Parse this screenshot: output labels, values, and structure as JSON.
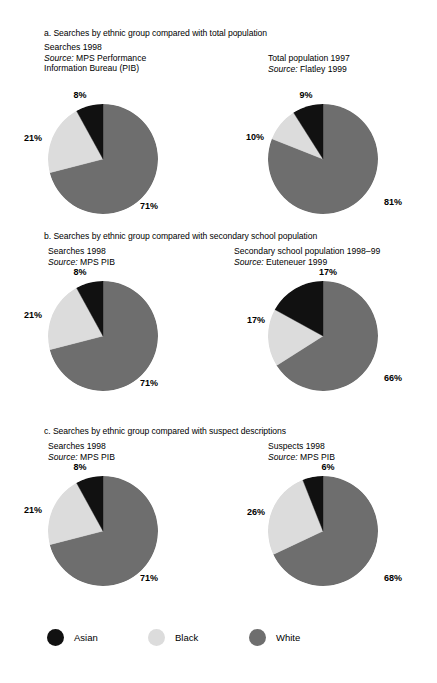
{
  "colors": {
    "asian": "#111111",
    "black": "#dcdcdc",
    "white": "#6e6e6e",
    "background": "#ffffff",
    "text": "#000000"
  },
  "legend": {
    "items": [
      {
        "label": "Asian",
        "color": "#111111",
        "swatch_name": "legend-swatch-asian"
      },
      {
        "label": "Black",
        "color": "#dcdcdc",
        "swatch_name": "legend-swatch-black"
      },
      {
        "label": "White",
        "color": "#6e6e6e",
        "swatch_name": "legend-swatch-white"
      }
    ]
  },
  "sections": [
    {
      "title": "a. Searches by ethnic group compared with total population",
      "left": {
        "heading": "Searches 1998",
        "source_word": "Source:",
        "source_lines": [
          " MPS Performance",
          "Information Bureau (PIB)"
        ]
      },
      "right": {
        "heading": "Total population 1997",
        "source_word": "Source:",
        "source_lines": [
          " Flatley 1999"
        ]
      }
    },
    {
      "title": "b. Searches by ethnic group compared with secondary school population",
      "left": {
        "heading": "Searches 1998",
        "source_word": "Source:",
        "source_lines": [
          " MPS  PIB"
        ]
      },
      "right": {
        "heading": "Secondary school population 1998–99",
        "source_word": "Source:",
        "source_lines": [
          " Euteneuer 1999"
        ]
      }
    },
    {
      "title": "c. Searches by ethnic group compared with suspect descriptions",
      "left": {
        "heading": "Searches 1998",
        "source_word": "Source:",
        "source_lines": [
          " MPS  PIB"
        ]
      },
      "right": {
        "heading": "Suspects 1998",
        "source_word": "Source:",
        "source_lines": [
          " MPS  PIB"
        ]
      }
    }
  ],
  "chart_data": [
    {
      "type": "pie",
      "title": "Searches 1998",
      "id": "a-left",
      "labels": [
        "White",
        "Black",
        "Asian"
      ],
      "values": [
        71,
        21,
        8
      ],
      "value_labels": [
        "71%",
        "21%",
        "8%"
      ],
      "colors": [
        "#6e6e6e",
        "#dcdcdc",
        "#111111"
      ],
      "start_angle_deg": 0,
      "direction": "clockwise",
      "legend": "shared-bottom"
    },
    {
      "type": "pie",
      "title": "Total population 1997",
      "id": "a-right",
      "labels": [
        "White",
        "Black",
        "Asian"
      ],
      "values": [
        81,
        10,
        9
      ],
      "value_labels": [
        "81%",
        "10%",
        "9%"
      ],
      "colors": [
        "#6e6e6e",
        "#dcdcdc",
        "#111111"
      ],
      "start_angle_deg": 0,
      "direction": "clockwise",
      "legend": "shared-bottom"
    },
    {
      "type": "pie",
      "title": "Searches 1998",
      "id": "b-left",
      "labels": [
        "White",
        "Black",
        "Asian"
      ],
      "values": [
        71,
        21,
        8
      ],
      "value_labels": [
        "71%",
        "21%",
        "8%"
      ],
      "colors": [
        "#6e6e6e",
        "#dcdcdc",
        "#111111"
      ],
      "start_angle_deg": 0,
      "direction": "clockwise",
      "legend": "shared-bottom"
    },
    {
      "type": "pie",
      "title": "Secondary school population 1998–99",
      "id": "b-right",
      "labels": [
        "White",
        "Black",
        "Asian"
      ],
      "values": [
        66,
        17,
        17
      ],
      "value_labels": [
        "66%",
        "17%",
        "17%"
      ],
      "colors": [
        "#6e6e6e",
        "#dcdcdc",
        "#111111"
      ],
      "start_angle_deg": 0,
      "direction": "clockwise",
      "legend": "shared-bottom"
    },
    {
      "type": "pie",
      "title": "Searches 1998",
      "id": "c-left",
      "labels": [
        "White",
        "Black",
        "Asian"
      ],
      "values": [
        71,
        21,
        8
      ],
      "value_labels": [
        "71%",
        "21%",
        "8%"
      ],
      "colors": [
        "#6e6e6e",
        "#dcdcdc",
        "#111111"
      ],
      "start_angle_deg": 0,
      "direction": "clockwise",
      "legend": "shared-bottom"
    },
    {
      "type": "pie",
      "title": "Suspects 1998",
      "id": "c-right",
      "labels": [
        "White",
        "Black",
        "Asian"
      ],
      "values": [
        68,
        26,
        6
      ],
      "value_labels": [
        "68%",
        "26%",
        "6%"
      ],
      "colors": [
        "#6e6e6e",
        "#dcdcdc",
        "#111111"
      ],
      "start_angle_deg": 0,
      "direction": "clockwise",
      "legend": "shared-bottom"
    }
  ]
}
